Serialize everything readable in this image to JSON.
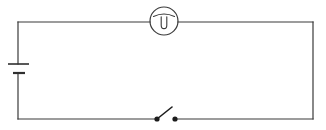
{
  "figure": {
    "background_color": "#ffffff",
    "line_color": "#3a3a3a",
    "width": 326,
    "height": 130
  },
  "circuit": {
    "loop": {
      "left_x": 18,
      "right_x": 313,
      "top_y": 22,
      "bottom_y": 119
    },
    "battery": {
      "label": "battery-cell",
      "position_x": 18,
      "long_plate": {
        "y": 64,
        "x1": 8,
        "x2": 29
      },
      "short_plate": {
        "y": 73,
        "x1": 13,
        "x2": 25
      }
    },
    "meter": {
      "label": "meter-lamp",
      "center_x": 164,
      "center_y": 21,
      "radius": 14,
      "glyph": "filament-loop"
    },
    "switch": {
      "label": "open-switch",
      "state": "open",
      "left_terminal_x": 157,
      "right_terminal_x": 175,
      "terminal_y": 119,
      "dot_radius": 2.6,
      "lever_tip_x": 172,
      "lever_tip_y": 107
    }
  }
}
